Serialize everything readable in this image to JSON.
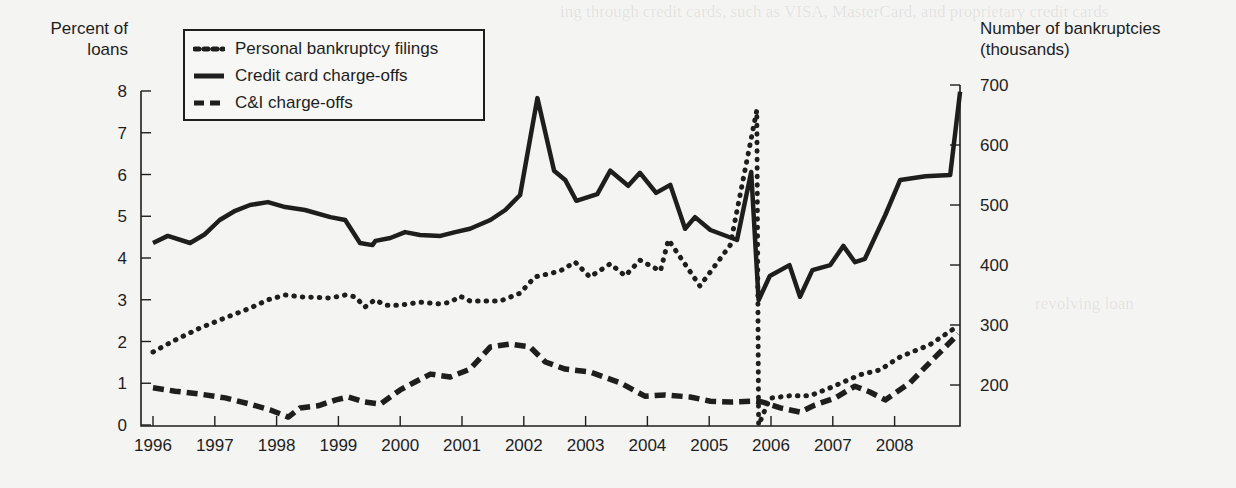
{
  "chart_data": {
    "type": "line",
    "title": "",
    "xlabel": "",
    "ylabel_left": "Percent of loans",
    "ylabel_right": "Number of bankruptcies (thousands)",
    "left_axis": {
      "ylim": [
        0,
        8
      ],
      "ticks": [
        0,
        1,
        2,
        3,
        4,
        5,
        6,
        7,
        8
      ]
    },
    "right_axis": {
      "ylim": [
        200,
        700
      ],
      "ticks": [
        200,
        300,
        400,
        500,
        600,
        700
      ]
    },
    "x_ticks": [
      "1996",
      "1997",
      "1998",
      "1999",
      "2000",
      "2001",
      "2002",
      "2003",
      "2004",
      "2005",
      "2006",
      "2007",
      "2008"
    ],
    "grid": false,
    "legend_position": "upper-left (inside plot)",
    "series": [
      {
        "name": "Personal bankruptcy filings",
        "axis": "right",
        "style": "dotted",
        "points": [
          [
            1996.0,
            255
          ],
          [
            1996.36,
            275
          ],
          [
            1996.76,
            295
          ],
          [
            1997.17,
            312
          ],
          [
            1997.57,
            328
          ],
          [
            1997.86,
            342
          ],
          [
            1998.14,
            350
          ],
          [
            1998.38,
            347
          ],
          [
            1998.87,
            345
          ],
          [
            1999.11,
            350
          ],
          [
            1999.27,
            347
          ],
          [
            1999.43,
            330
          ],
          [
            1999.59,
            342
          ],
          [
            1999.76,
            333
          ],
          [
            2000.0,
            333
          ],
          [
            2000.32,
            338
          ],
          [
            2000.65,
            335
          ],
          [
            2000.81,
            338
          ],
          [
            2000.97,
            348
          ],
          [
            2001.13,
            340
          ],
          [
            2001.62,
            340
          ],
          [
            2001.94,
            353
          ],
          [
            2002.18,
            380
          ],
          [
            2002.59,
            390
          ],
          [
            2002.83,
            405
          ],
          [
            2003.07,
            380
          ],
          [
            2003.4,
            402
          ],
          [
            2003.64,
            382
          ],
          [
            2003.88,
            408
          ],
          [
            2004.21,
            390
          ],
          [
            2004.34,
            442
          ],
          [
            2004.85,
            365
          ],
          [
            2005.34,
            433
          ],
          [
            2005.77,
            658
          ],
          [
            2005.8,
            133
          ],
          [
            2005.98,
            178
          ],
          [
            2006.3,
            182
          ],
          [
            2006.63,
            182
          ],
          [
            2006.95,
            195
          ],
          [
            2007.44,
            217
          ],
          [
            2007.76,
            225
          ],
          [
            2008.09,
            247
          ],
          [
            2008.57,
            267
          ],
          [
            2009.02,
            298
          ]
        ]
      },
      {
        "name": "Credit card charge-offs",
        "axis": "left",
        "style": "solid",
        "points": [
          [
            1996.0,
            4.36
          ],
          [
            1996.24,
            4.53
          ],
          [
            1996.6,
            4.36
          ],
          [
            1996.84,
            4.57
          ],
          [
            1997.08,
            4.91
          ],
          [
            1997.33,
            5.13
          ],
          [
            1997.57,
            5.27
          ],
          [
            1997.86,
            5.34
          ],
          [
            1998.14,
            5.22
          ],
          [
            1998.46,
            5.15
          ],
          [
            1998.87,
            4.98
          ],
          [
            1999.11,
            4.91
          ],
          [
            1999.35,
            4.36
          ],
          [
            1999.55,
            4.31
          ],
          [
            1999.6,
            4.41
          ],
          [
            1999.84,
            4.48
          ],
          [
            2000.08,
            4.62
          ],
          [
            2000.32,
            4.55
          ],
          [
            2000.65,
            4.53
          ],
          [
            2000.89,
            4.62
          ],
          [
            2001.13,
            4.7
          ],
          [
            2001.46,
            4.91
          ],
          [
            2001.7,
            5.15
          ],
          [
            2001.94,
            5.51
          ],
          [
            2002.22,
            7.83
          ],
          [
            2002.49,
            6.09
          ],
          [
            2002.67,
            5.87
          ],
          [
            2002.85,
            5.37
          ],
          [
            2003.19,
            5.53
          ],
          [
            2003.4,
            6.09
          ],
          [
            2003.69,
            5.73
          ],
          [
            2003.88,
            6.04
          ],
          [
            2004.14,
            5.56
          ],
          [
            2004.37,
            5.75
          ],
          [
            2004.61,
            4.7
          ],
          [
            2004.77,
            4.98
          ],
          [
            2005.02,
            4.67
          ],
          [
            2005.45,
            4.43
          ],
          [
            2005.68,
            6.06
          ],
          [
            2005.8,
            2.99
          ],
          [
            2005.98,
            3.57
          ],
          [
            2006.3,
            3.83
          ],
          [
            2006.47,
            3.07
          ],
          [
            2006.67,
            3.71
          ],
          [
            2006.96,
            3.83
          ],
          [
            2007.17,
            4.29
          ],
          [
            2007.36,
            3.9
          ],
          [
            2007.52,
            3.98
          ],
          [
            2007.85,
            5.03
          ],
          [
            2008.09,
            5.87
          ],
          [
            2008.5,
            5.96
          ],
          [
            2008.9,
            5.99
          ],
          [
            2009.06,
            7.98
          ]
        ]
      },
      {
        "name": "C&I charge-offs",
        "axis": "left",
        "style": "dashed",
        "points": [
          [
            1996.0,
            0.89
          ],
          [
            1996.36,
            0.81
          ],
          [
            1996.76,
            0.74
          ],
          [
            1997.17,
            0.65
          ],
          [
            1997.57,
            0.5
          ],
          [
            1997.9,
            0.36
          ],
          [
            1998.19,
            0.19
          ],
          [
            1998.38,
            0.41
          ],
          [
            1998.67,
            0.46
          ],
          [
            1998.96,
            0.6
          ],
          [
            1999.16,
            0.67
          ],
          [
            1999.43,
            0.55
          ],
          [
            1999.68,
            0.5
          ],
          [
            2000.0,
            0.84
          ],
          [
            2000.24,
            1.03
          ],
          [
            2000.49,
            1.22
          ],
          [
            2000.81,
            1.15
          ],
          [
            2001.13,
            1.34
          ],
          [
            2001.46,
            1.87
          ],
          [
            2001.78,
            1.94
          ],
          [
            2002.1,
            1.87
          ],
          [
            2002.35,
            1.51
          ],
          [
            2002.67,
            1.34
          ],
          [
            2003.07,
            1.27
          ],
          [
            2003.56,
            1.01
          ],
          [
            2003.96,
            0.69
          ],
          [
            2004.29,
            0.72
          ],
          [
            2004.69,
            0.67
          ],
          [
            2005.02,
            0.57
          ],
          [
            2005.34,
            0.55
          ],
          [
            2005.74,
            0.57
          ],
          [
            2005.86,
            0.55
          ],
          [
            2006.15,
            0.41
          ],
          [
            2006.47,
            0.31
          ],
          [
            2006.71,
            0.48
          ],
          [
            2007.04,
            0.65
          ],
          [
            2007.36,
            0.93
          ],
          [
            2007.6,
            0.79
          ],
          [
            2007.85,
            0.6
          ],
          [
            2008.25,
            1.01
          ],
          [
            2008.66,
            1.63
          ],
          [
            2009.03,
            2.18
          ]
        ]
      }
    ]
  },
  "axis_titles": {
    "left_line1": "Percent of",
    "left_line2": "loans",
    "right_line1": "Number of bankruptcies",
    "right_line2": "(thousands)"
  },
  "legend": {
    "items": [
      {
        "label": "Personal bankruptcy filings",
        "style": "dotted"
      },
      {
        "label": "Credit card charge-offs",
        "style": "solid"
      },
      {
        "label": "C&I charge-offs",
        "style": "dashed"
      }
    ]
  },
  "colors": {
    "background": "#f4f4f2",
    "ink": "#1e1e1e"
  }
}
